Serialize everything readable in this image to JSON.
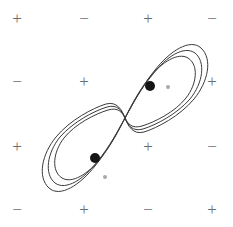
{
  "figure": {
    "width": 233,
    "height": 227,
    "background_color": "#ffffff",
    "curve_color": "#3a3a3a",
    "sign_color": "#6d6d6d",
    "focal_dot_color": "#151515",
    "small_marker_color": "#a8a8a8"
  },
  "sign_grid": {
    "rows": 4,
    "cols": 4,
    "row_y": [
      19,
      82,
      147,
      210
    ],
    "col_x": [
      17,
      84,
      148,
      212
    ],
    "cells": [
      {
        "name": "sign-r1c1",
        "label": "+",
        "x": 17,
        "y": 19,
        "visible": true
      },
      {
        "name": "sign-r1c2",
        "label": "−",
        "x": 84,
        "y": 19,
        "visible": true
      },
      {
        "name": "sign-r1c3",
        "label": "+",
        "x": 148,
        "y": 19,
        "visible": true
      },
      {
        "name": "sign-r1c4",
        "label": "−",
        "x": 212,
        "y": 19,
        "visible": true
      },
      {
        "name": "sign-r2c1",
        "label": "−",
        "x": 17,
        "y": 82,
        "visible": true
      },
      {
        "name": "sign-r2c2",
        "label": "+",
        "x": 84,
        "y": 82,
        "visible": true
      },
      {
        "name": "sign-r2c4",
        "label": "+",
        "x": 212,
        "y": 82,
        "visible": true
      },
      {
        "name": "sign-r3c1",
        "label": "+",
        "x": 17,
        "y": 147,
        "visible": true
      },
      {
        "name": "sign-r3c3",
        "label": "+",
        "x": 148,
        "y": 147,
        "visible": true
      },
      {
        "name": "sign-r3c4",
        "label": "−",
        "x": 212,
        "y": 147,
        "visible": true
      },
      {
        "name": "sign-r4c1",
        "label": "−",
        "x": 17,
        "y": 210,
        "visible": true
      },
      {
        "name": "sign-r4c2",
        "label": "+",
        "x": 84,
        "y": 210,
        "visible": true
      },
      {
        "name": "sign-r4c3",
        "label": "−",
        "x": 148,
        "y": 210,
        "visible": true
      },
      {
        "name": "sign-r4c4",
        "label": "+",
        "x": 212,
        "y": 210,
        "visible": true
      }
    ]
  },
  "markers": {
    "focal_dots": [
      {
        "name": "focal-dot-upper",
        "x": 150,
        "y": 86,
        "r": 5.0
      },
      {
        "name": "focal-dot-lower",
        "x": 95,
        "y": 158,
        "r": 5.0
      }
    ],
    "small_markers": [
      {
        "name": "small-marker-upper",
        "x": 168,
        "y": 87,
        "r": 2.0
      },
      {
        "name": "small-marker-lower",
        "x": 105,
        "y": 177,
        "r": 2.0
      }
    ]
  },
  "curves": {
    "inner": {
      "name": "inner-lemniscate",
      "stroke_width": 1.0,
      "path": "M 125 118 C 131 106 138 92 150 77 C 162 62 178 52 188 58 C 199 65 197 84 186 98 C 175 112 155 122 142 126 C 132 129 128 124 125 118 Z M 125 118 C 119 130 112 144 100 159 C 88 174 72 184 62 178 C 51 171 53 152 64 138 C 75 124 95 114 108 110 C 118 107 122 112 125 118 Z"
    },
    "outer": {
      "name": "outer-lemniscate",
      "stroke_width": 1.0,
      "path": "M 125 118 C 133 104 141 87 155 70 C 170 51 190 38 201 48 C 213 59 208 82 194 99 C 180 116 157 128 144 132 C 133 135 128 126 125 118 Z M 125 118 C 117 132 109 149 95 166 C 80 185 60 198 49 188 C 37 177 42 154 56 137 C 70 120 93 108 106 104 C 117 101 122 110 125 118 Z"
    },
    "middle": {
      "name": "middle-lemniscate",
      "stroke_width": 1.0,
      "path": "M 125 118 C 132 105 140 90 153 74 C 166 57 184 45 195 53 C 206 62 203 83 190 99 C 177 114 156 125 143 129 C 132 132 128 125 125 118 Z M 125 118 C 118 131 110 146 97 162 C 84 179 66 191 55 183 C 44 174 47 153 60 137 C 73 122 94 111 107 107 C 118 104 122 111 125 118 Z"
    }
  }
}
